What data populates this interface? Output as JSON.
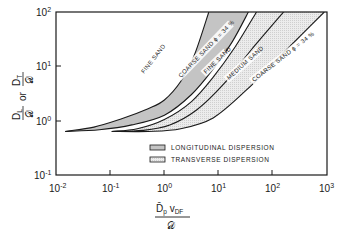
{
  "chart_data": {
    "type": "area",
    "title": "",
    "xlabel": "D̄p vDF / 𝒟",
    "ylabel": "DL/𝒟 or DT/𝒟",
    "xscale": "log",
    "yscale": "log",
    "xlim": [
      0.01,
      1000
    ],
    "ylim": [
      0.1,
      100
    ],
    "grid": false,
    "x_ticks": [
      {
        "base": "10",
        "exp": "-2",
        "value": 0.01
      },
      {
        "base": "10",
        "exp": "-1",
        "value": 0.1
      },
      {
        "base": "10",
        "exp": "0",
        "value": 1
      },
      {
        "base": "10",
        "exp": "1",
        "value": 10
      },
      {
        "base": "10",
        "exp": "2",
        "value": 100
      },
      {
        "base": "10",
        "exp": "3",
        "value": 1000
      }
    ],
    "y_ticks": [
      {
        "base": "10",
        "exp": "-1",
        "value": 0.1
      },
      {
        "base": "10",
        "exp": "0",
        "value": 1
      },
      {
        "base": "10",
        "exp": "1",
        "value": 10
      },
      {
        "base": "10",
        "exp": "2",
        "value": 100
      }
    ],
    "series": [
      {
        "name": "FINE SAND",
        "group": "longitudinal",
        "role": "upper boundary of longitudinal band",
        "log_points": [
          [
            -1.83,
            -0.2
          ],
          [
            -1.3,
            -0.12
          ],
          [
            -0.8,
            0.03
          ],
          [
            -0.3,
            0.22
          ],
          [
            0.0,
            0.38
          ],
          [
            0.3,
            0.72
          ],
          [
            0.55,
            1.2
          ],
          [
            0.82,
            2.0
          ]
        ]
      },
      {
        "name": "COARSE SAND ϕ = 34 %",
        "group": "longitudinal",
        "role": "lower boundary of longitudinal band",
        "log_points": [
          [
            -1.83,
            -0.2
          ],
          [
            -1.2,
            -0.17
          ],
          [
            -0.6,
            -0.08
          ],
          [
            0.0,
            0.1
          ],
          [
            0.5,
            0.48
          ],
          [
            0.9,
            0.95
          ],
          [
            1.25,
            1.45
          ],
          [
            1.55,
            2.0
          ]
        ]
      },
      {
        "name": "FINE SAND",
        "group": "transverse",
        "role": "upper boundary of transverse band",
        "log_points": [
          [
            -0.97,
            -0.2
          ],
          [
            -0.5,
            -0.15
          ],
          [
            0.0,
            0.02
          ],
          [
            0.5,
            0.35
          ],
          [
            0.9,
            0.8
          ],
          [
            1.3,
            1.35
          ],
          [
            1.7,
            2.0
          ]
        ]
      },
      {
        "name": "MEDIUM SAND",
        "group": "transverse",
        "role": "middle curve of transverse band",
        "log_points": [
          [
            -0.97,
            -0.2
          ],
          [
            -0.4,
            -0.18
          ],
          [
            0.1,
            -0.08
          ],
          [
            0.6,
            0.2
          ],
          [
            1.1,
            0.68
          ],
          [
            1.6,
            1.3
          ],
          [
            2.2,
            2.0
          ]
        ]
      },
      {
        "name": "COARSE SAND ϕ = 34 %",
        "group": "transverse",
        "role": "lower boundary of transverse band",
        "log_points": [
          [
            -0.97,
            -0.2
          ],
          [
            -0.3,
            -0.2
          ],
          [
            0.3,
            -0.15
          ],
          [
            0.9,
            0.05
          ],
          [
            1.5,
            0.55
          ],
          [
            2.1,
            1.15
          ],
          [
            2.5,
            1.55
          ],
          [
            2.95,
            2.0
          ]
        ]
      }
    ],
    "bands": [
      {
        "name": "LONGITUDINAL DISPERSION",
        "upper": 0,
        "lower": 1,
        "fill": "#c4c4c4"
      },
      {
        "name": "TRANSVERSE DISPERSION",
        "upper": 2,
        "lower": 4,
        "fill": "#e6e6e6"
      }
    ],
    "legend": {
      "position": "lower right inside",
      "entries": [
        {
          "label": "LONGITUDINAL DISPERSION",
          "swatch": "#c4c4c4"
        },
        {
          "label": "TRANSVERSE DISPERSION",
          "swatch": "#e6e6e6"
        }
      ]
    }
  },
  "labels": {
    "y_axis": {
      "top_num": "D",
      "top_num_sub": "T",
      "top_den": "𝒟",
      "or": "or",
      "bot_num": "D",
      "bot_num_sub": "L",
      "bot_den": "𝒟"
    },
    "x_axis": {
      "num_main": "D̄",
      "num_main_sub": "p",
      "num_v": "v",
      "num_v_sub": "DF",
      "den": "𝒟"
    },
    "curves": {
      "fine_sand_long": "FINE  SAND",
      "coarse_sand_long": "COARSE SAND ϕ = 34 %",
      "fine_sand_trans": "FINE  SAND",
      "medium_sand": "MEDIUM SAND",
      "coarse_sand_trans": "COARSE  SAND ϕ = 34 %"
    }
  },
  "colors": {
    "longitudinal_fill": "#c4c4c4",
    "transverse_fill": "#e6e6e6",
    "line": "#1a1a1a"
  }
}
